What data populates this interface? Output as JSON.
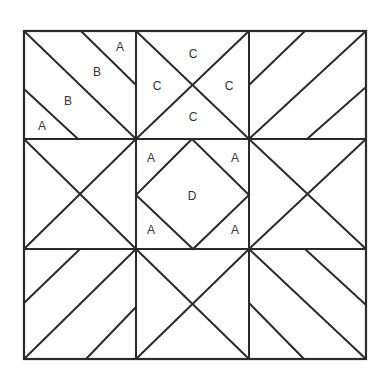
{
  "diagram": {
    "colors": {
      "line": "#2b2b2b",
      "text": "#333333",
      "background": "#ffffff"
    },
    "grid": {
      "x": [
        24,
        136,
        249,
        366
      ],
      "y": [
        31,
        139,
        249,
        359
      ]
    },
    "labels": [
      {
        "text": "A",
        "x": 120,
        "y": 47
      },
      {
        "text": "B",
        "x": 97,
        "y": 72
      },
      {
        "text": "B",
        "x": 68,
        "y": 101
      },
      {
        "text": "A",
        "x": 42,
        "y": 126
      },
      {
        "text": "C",
        "x": 193,
        "y": 54
      },
      {
        "text": "C",
        "x": 157,
        "y": 86
      },
      {
        "text": "C",
        "x": 229,
        "y": 86
      },
      {
        "text": "C",
        "x": 193,
        "y": 117
      },
      {
        "text": "A",
        "x": 151,
        "y": 158
      },
      {
        "text": "A",
        "x": 235,
        "y": 158
      },
      {
        "text": "D",
        "x": 192,
        "y": 196
      },
      {
        "text": "A",
        "x": 151,
        "y": 230
      },
      {
        "text": "A",
        "x": 235,
        "y": 230
      }
    ]
  }
}
